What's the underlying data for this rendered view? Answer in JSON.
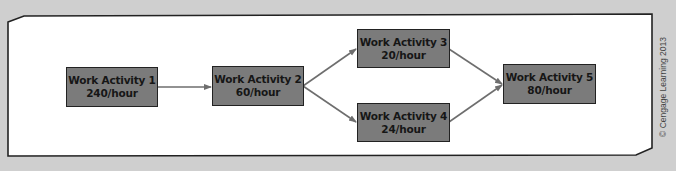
{
  "diagram": {
    "type": "process-flow",
    "colors": {
      "background": "#cfcfcf",
      "panel": "#ffffff",
      "panel_border": "#222222",
      "node_fill": "#7b7b7b",
      "node_border": "#222222",
      "node_text": "#161616",
      "arrow": "#6e6e6e"
    },
    "nodes": [
      {
        "id": "wa1",
        "title": "Work Activity 1",
        "rate": "240/hour"
      },
      {
        "id": "wa2",
        "title": "Work Activity 2",
        "rate": "60/hour"
      },
      {
        "id": "wa3",
        "title": "Work Activity 3",
        "rate": "20/hour"
      },
      {
        "id": "wa4",
        "title": "Work Activity 4",
        "rate": "24/hour"
      },
      {
        "id": "wa5",
        "title": "Work Activity 5",
        "rate": "80/hour"
      }
    ],
    "edges": [
      {
        "from": "wa1",
        "to": "wa2"
      },
      {
        "from": "wa2",
        "to": "wa3"
      },
      {
        "from": "wa2",
        "to": "wa4"
      },
      {
        "from": "wa3",
        "to": "wa5"
      },
      {
        "from": "wa4",
        "to": "wa5"
      }
    ],
    "credit": "© Cengage Learning 2013"
  }
}
